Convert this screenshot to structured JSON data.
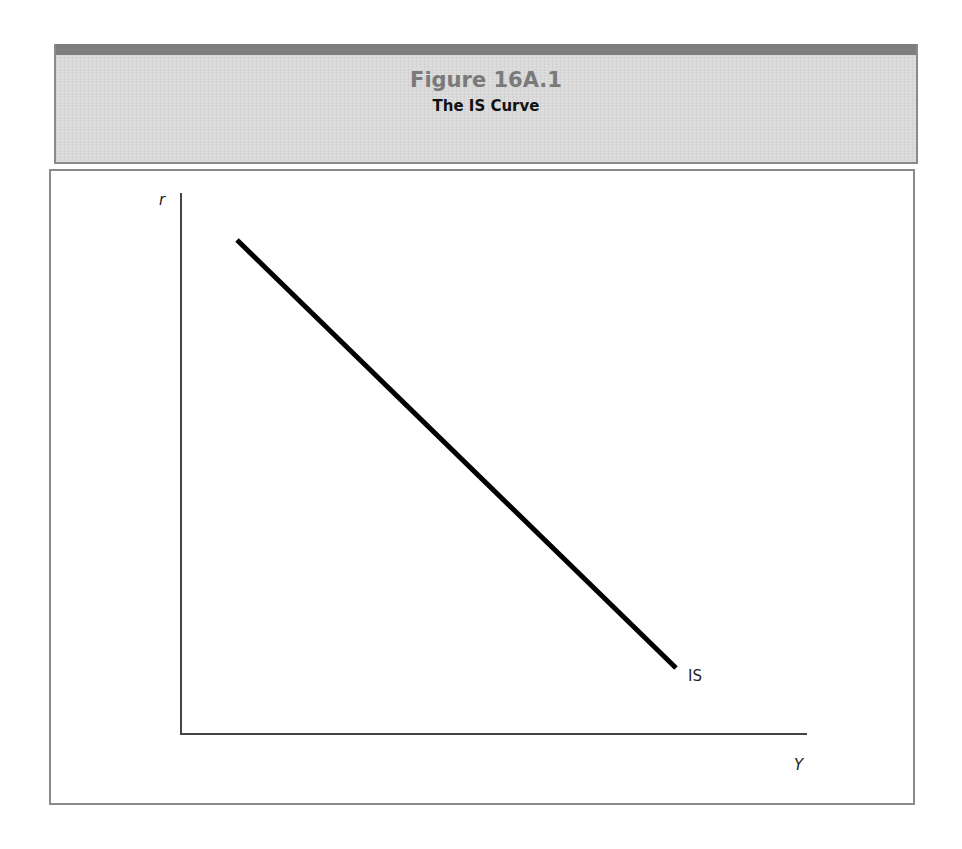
{
  "figure": {
    "number": "Figure 16A.1",
    "title": "The IS Curve"
  },
  "chart_data": {
    "type": "line",
    "title": "The IS Curve",
    "xlabel": "Y",
    "ylabel": "r",
    "grid": false,
    "legend": "none",
    "ticks": "none",
    "series": [
      {
        "name": "IS",
        "label": "IS",
        "shape": "straight downward-sloping line",
        "points_px": [
          [
            237,
            240
          ],
          [
            676,
            668
          ]
        ],
        "points_normalized": [
          [
            0.091,
            0.914
          ],
          [
            0.793,
            0.124
          ]
        ],
        "color": "#000000"
      }
    ],
    "axes": {
      "origin_px": [
        181,
        734
      ],
      "y_axis_top_px": 193,
      "x_axis_right_px": 807
    }
  },
  "colors": {
    "header_bg": "#d9d9d9",
    "header_band": "#7e7e7e",
    "border": "#8a8a8a",
    "figure_number": "#7a7a7a",
    "title": "#111111",
    "curve": "#000000",
    "axis": "#444444"
  }
}
